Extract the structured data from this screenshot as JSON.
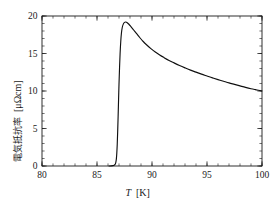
{
  "chart_data": {
    "type": "line",
    "title": "",
    "subtitle": "",
    "xlabel_symbol": "T",
    "xlabel_unit": "[K]",
    "ylabel_text": "電気抵抗率",
    "ylabel_unit": "[μΩcm]",
    "xlim": [
      80,
      100
    ],
    "ylim": [
      0,
      20
    ],
    "xticks": [
      80,
      85,
      90,
      95,
      100
    ],
    "yticks": [
      0,
      5,
      10,
      15,
      20
    ],
    "xtick_labels": [
      "80",
      "85",
      "90",
      "95",
      "100"
    ],
    "ytick_labels": [
      "0",
      "5",
      "10",
      "15",
      "20"
    ],
    "x_minor_step": 1,
    "y_minor_step": 1,
    "grid": false,
    "legend": "none",
    "series": [
      {
        "name": "resistivity",
        "color": "#101010",
        "x": [
          86.1,
          86.3,
          86.45,
          86.55,
          86.62,
          86.68,
          86.72,
          86.76,
          86.8,
          86.84,
          86.88,
          86.92,
          86.96,
          87.0,
          87.05,
          87.1,
          87.16,
          87.22,
          87.3,
          87.4,
          87.5,
          87.62,
          87.75,
          87.9,
          88.1,
          88.35,
          88.6,
          88.9,
          89.2,
          89.55,
          89.9,
          90.3,
          90.7,
          91.1,
          91.55,
          92.0,
          92.5,
          93.0,
          93.5,
          94.0,
          94.5,
          95.0,
          95.5,
          96.0,
          96.5,
          97.0,
          97.5,
          98.0,
          98.5,
          99.0,
          99.4,
          99.7,
          100.0
        ],
        "y": [
          0.0,
          0.02,
          0.05,
          0.1,
          0.18,
          0.32,
          0.55,
          0.95,
          1.7,
          2.9,
          4.6,
          6.6,
          8.8,
          10.9,
          13.1,
          15.0,
          16.6,
          17.7,
          18.5,
          18.95,
          19.15,
          19.2,
          19.1,
          18.9,
          18.55,
          18.1,
          17.65,
          17.1,
          16.6,
          16.1,
          15.65,
          15.2,
          14.8,
          14.45,
          14.08,
          13.75,
          13.4,
          13.08,
          12.78,
          12.52,
          12.25,
          12.0,
          11.75,
          11.52,
          11.3,
          11.08,
          10.88,
          10.68,
          10.48,
          10.3,
          10.18,
          10.1,
          10.0
        ]
      }
    ],
    "annotations": {
      "peak_temperature": 87.62,
      "peak_value": 19.2,
      "transition_onset": 86.1,
      "value_at_100K": 10.0
    }
  },
  "figure": {
    "background_color": "#ffffff",
    "line_color": "#101010",
    "axis_color": "#1a1a1a"
  }
}
